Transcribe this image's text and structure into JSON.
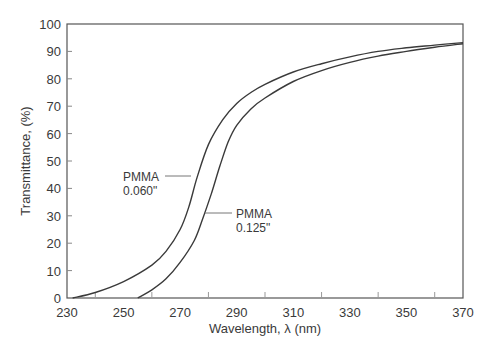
{
  "chart_data": {
    "type": "line",
    "title": "",
    "xlabel": "Wavelength, λ (nm)",
    "ylabel": "Transmittance, (%)",
    "xlim": [
      230,
      370
    ],
    "ylim": [
      0,
      100
    ],
    "x_ticks": [
      230,
      250,
      270,
      290,
      310,
      330,
      350,
      370
    ],
    "x_minor_ticks": [
      240,
      260,
      280,
      300,
      320,
      340,
      360
    ],
    "y_ticks": [
      0,
      10,
      20,
      30,
      40,
      50,
      60,
      70,
      80,
      90,
      100
    ],
    "grid": false,
    "legend": null,
    "series": [
      {
        "name": "PMMA 0.060\"",
        "x": [
          232,
          240,
          250,
          260,
          265,
          270,
          273,
          276,
          280,
          285,
          290,
          295,
          300,
          310,
          320,
          330,
          340,
          350,
          360,
          370
        ],
        "values": [
          0,
          2,
          6,
          12,
          17,
          25,
          33,
          44,
          56,
          65,
          71,
          75,
          78,
          82.5,
          85.5,
          88,
          90,
          91.3,
          92.3,
          93.2
        ]
      },
      {
        "name": "PMMA 0.125\"",
        "x": [
          255,
          260,
          265,
          270,
          275,
          278,
          281,
          284,
          287,
          290,
          295,
          300,
          310,
          320,
          330,
          340,
          350,
          360,
          370
        ],
        "values": [
          0,
          3,
          7,
          13,
          21,
          29,
          38,
          48,
          57,
          63,
          69,
          73,
          79,
          83,
          86,
          88.3,
          90,
          91.5,
          92.8
        ]
      }
    ],
    "annotations": [
      {
        "line1": "PMMA",
        "line2": "0.060\"",
        "points_to_series": 0,
        "anchor_x": 274,
        "anchor_y": 45
      },
      {
        "line1": "PMMA",
        "line2": "0.125\"",
        "points_to_series": 1,
        "anchor_x": 279,
        "anchor_y": 34
      }
    ]
  },
  "axes": {
    "xlabel": "Wavelength,  λ  (nm)",
    "ylabel": "Transmittance, (%)"
  },
  "labels": {
    "a1_line1": "PMMA",
    "a1_line2": "0.060\"",
    "a2_line1": "PMMA",
    "a2_line2": "0.125\""
  },
  "colors": {
    "line": "#3a3a3a",
    "axis": "#555555",
    "text": "#3a3a3a"
  }
}
